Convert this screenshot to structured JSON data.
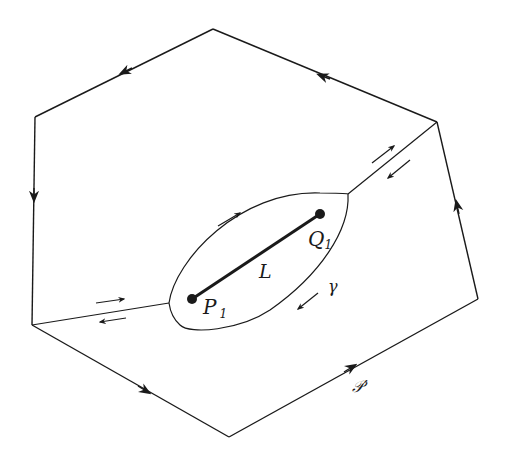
{
  "diagram": {
    "colors": {
      "stroke": "#1a1a1a",
      "background": "#ffffff"
    },
    "polygon": {
      "name": "P-prime",
      "label": "𝒫′",
      "vertices": [
        {
          "id": "top",
          "x": 213,
          "y": 29
        },
        {
          "id": "right-top",
          "x": 437,
          "y": 122
        },
        {
          "id": "right-bottom",
          "x": 478,
          "y": 299
        },
        {
          "id": "bottom",
          "x": 229,
          "y": 437
        },
        {
          "id": "left-bottom",
          "x": 32,
          "y": 325
        },
        {
          "id": "left-top",
          "x": 35,
          "y": 117
        }
      ],
      "orientation": "counterclockwise"
    },
    "loop": {
      "label": "γ",
      "left_junction": {
        "x": 169,
        "y": 303
      },
      "right_junction": {
        "x": 348,
        "y": 194
      }
    },
    "segment": {
      "label": "L",
      "start": {
        "label": "P",
        "subscript": "1",
        "x": 192,
        "y": 299
      },
      "end": {
        "label": "Q",
        "subscript": "1",
        "x": 320,
        "y": 214
      }
    },
    "cuts": [
      {
        "from": "left-bottom",
        "to": "left_junction",
        "arrows": [
          "→",
          "←"
        ]
      },
      {
        "from": "right_junction",
        "to": "right-top",
        "arrows": [
          "→",
          "←"
        ]
      }
    ]
  }
}
